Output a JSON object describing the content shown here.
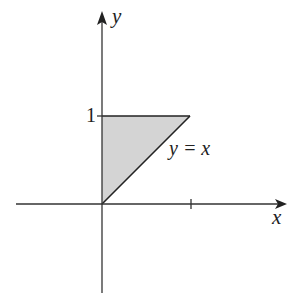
{
  "diagram": {
    "axes": {
      "x_label": "x",
      "y_label": "y",
      "tick_label_y": "1"
    },
    "region": {
      "description": "Shaded triangle bounded by x = 0, y = 1, and y = x",
      "vertices": [
        [
          0,
          0
        ],
        [
          0,
          1
        ],
        [
          1,
          1
        ]
      ],
      "fill": "#d4d4d4"
    },
    "curve_label": "y = x",
    "colors": {
      "stroke": "#222222",
      "fill": "#d4d4d4",
      "background": "#ffffff"
    }
  }
}
